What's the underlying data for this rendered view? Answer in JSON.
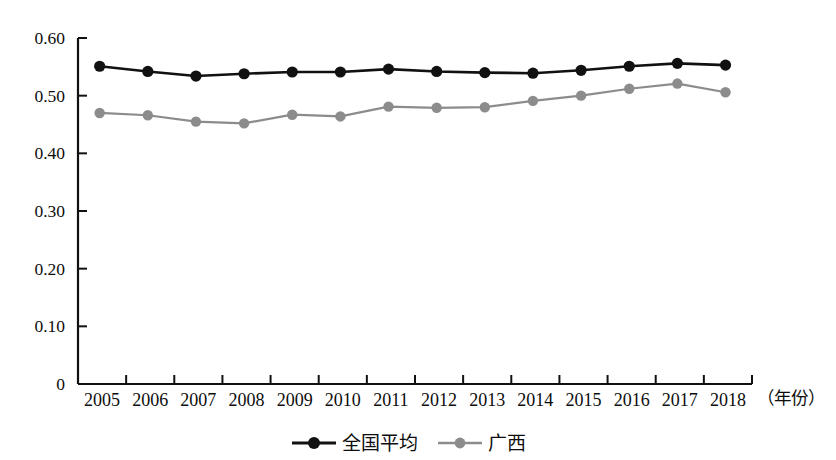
{
  "chart_data": {
    "type": "line",
    "title": "",
    "xlabel": "（年份）",
    "ylabel": "",
    "categories": [
      "2005",
      "2006",
      "2007",
      "2008",
      "2009",
      "2010",
      "2011",
      "2012",
      "2013",
      "2014",
      "2015",
      "2016",
      "2017",
      "2018"
    ],
    "x": [
      2005,
      2006,
      2007,
      2008,
      2009,
      2010,
      2011,
      2012,
      2013,
      2014,
      2015,
      2016,
      2017,
      2018
    ],
    "ylim": [
      0,
      0.6
    ],
    "xlim": [
      2005,
      2018
    ],
    "yticks": [
      0,
      0.1,
      0.2,
      0.3,
      0.4,
      0.5,
      0.6
    ],
    "ytick_labels": [
      "0",
      "0.10",
      "0.20",
      "0.30",
      "0.40",
      "0.50",
      "0.60"
    ],
    "grid": false,
    "legend_position": "bottom-center",
    "series": [
      {
        "name": "全国平均",
        "color": "#111111",
        "marker": "circle",
        "values": [
          0.551,
          0.542,
          0.534,
          0.538,
          0.541,
          0.541,
          0.546,
          0.542,
          0.54,
          0.539,
          0.544,
          0.551,
          0.556,
          0.553
        ]
      },
      {
        "name": "广西",
        "color": "#8c8c8c",
        "marker": "circle",
        "values": [
          0.47,
          0.466,
          0.455,
          0.452,
          0.467,
          0.464,
          0.481,
          0.479,
          0.48,
          0.491,
          0.5,
          0.512,
          0.521,
          0.506
        ]
      }
    ]
  },
  "axes": {
    "y_tick_labels": [
      "0.60",
      "0.50",
      "0.40",
      "0.30",
      "0.20",
      "0.10",
      "0"
    ],
    "x_tick_labels": [
      "2005",
      "2006",
      "2007",
      "2008",
      "2009",
      "2010",
      "2011",
      "2012",
      "2013",
      "2014",
      "2015",
      "2016",
      "2017",
      "2018"
    ],
    "x_axis_unit": "（年份）"
  },
  "legend": {
    "items": [
      {
        "label": "全国平均",
        "color": "#111111"
      },
      {
        "label": "广西",
        "color": "#8c8c8c"
      }
    ]
  },
  "colors": {
    "series_national": "#111111",
    "series_guangxi": "#8c8c8c",
    "axis": "#111111",
    "background": "#ffffff"
  }
}
